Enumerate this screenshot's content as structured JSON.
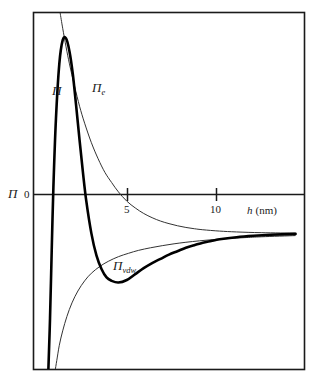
{
  "chart_data": {
    "type": "line",
    "title": "",
    "xlabel": "h (nm)",
    "ylabel": "Π",
    "xlabel_var": "h",
    "xlabel_unit": "(nm)",
    "xlim": [
      0,
      16
    ],
    "ylim": [
      -1.6,
      2.6
    ],
    "grid": false,
    "legend": "inline-annotations",
    "zero_label": "0",
    "xticks": [
      5,
      10
    ],
    "xtick_labels": [
      "5",
      "10"
    ],
    "yticks": [
      0
    ],
    "ytick_labels": [
      "0"
    ],
    "annotations": [
      {
        "name": "total-pressure-label",
        "text": "Π",
        "sub": "",
        "x": 52,
        "y": 95
      },
      {
        "name": "electrostatic-label",
        "text": "Π",
        "sub": "e",
        "x": 92,
        "y": 92
      },
      {
        "name": "vanderwaals-label",
        "text": "Π",
        "sub": "vdw",
        "x": 113,
        "y": 270
      }
    ],
    "series": [
      {
        "name": "Π",
        "label": "Π",
        "description": "Total DLVO disjoining pressure (sum of electrostatic and van der Waals); thick black curve with primary maximum, secondary minimum.",
        "style": "thick",
        "color": "#000000",
        "width": 2.6,
        "x": [
          0.85,
          0.95,
          1.05,
          1.15,
          1.3,
          1.5,
          1.7,
          1.9,
          2.1,
          2.3,
          2.5,
          2.7,
          2.9,
          3.1,
          3.4,
          3.7,
          4.0,
          4.3,
          4.6,
          5.0,
          5.5,
          6.0,
          6.5,
          7.0,
          7.5,
          8.0,
          8.5,
          9.0,
          9.5,
          10.0,
          10.5,
          11.0,
          12.0,
          13.0,
          14.0,
          15.5
        ],
        "y": [
          -1.62,
          -1.0,
          -0.2,
          0.55,
          1.35,
          2.0,
          2.28,
          2.3,
          2.15,
          1.88,
          1.5,
          1.1,
          0.72,
          0.38,
          0.0,
          -0.26,
          -0.42,
          -0.52,
          -0.56,
          -0.58,
          -0.55,
          -0.48,
          -0.41,
          -0.35,
          -0.3,
          -0.25,
          -0.21,
          -0.17,
          -0.14,
          -0.11,
          -0.09,
          -0.07,
          -0.045,
          -0.028,
          -0.016,
          -0.006
        ]
      },
      {
        "name": "Πe",
        "label": "Πe",
        "description": "Electrostatic double-layer repulsion; thin curve decaying monotonically from large positive values toward zero.",
        "style": "thin",
        "color": "#333333",
        "width": 1.0,
        "x": [
          1.55,
          1.7,
          1.9,
          2.1,
          2.4,
          2.7,
          3.0,
          3.4,
          3.8,
          4.2,
          4.6,
          5.0,
          5.5,
          6.0,
          6.5,
          7.0,
          7.5,
          8.0,
          8.5,
          9.0,
          9.5,
          10.0,
          11.0,
          12.0,
          13.5,
          15.5
        ],
        "y": [
          2.6,
          2.42,
          2.2,
          2.0,
          1.74,
          1.5,
          1.3,
          1.07,
          0.88,
          0.72,
          0.6,
          0.49,
          0.38,
          0.3,
          0.235,
          0.185,
          0.145,
          0.115,
          0.09,
          0.07,
          0.055,
          0.043,
          0.027,
          0.017,
          0.008,
          0.003
        ]
      },
      {
        "name": "Πvdw",
        "label": "Πvdw",
        "description": "van der Waals attraction; thin curve rising from large negative values asymptotically toward zero.",
        "style": "thin",
        "color": "#333333",
        "width": 1.0,
        "x": [
          1.25,
          1.35,
          1.5,
          1.7,
          1.95,
          2.25,
          2.6,
          3.0,
          3.4,
          3.9,
          4.4,
          5.0,
          5.6,
          6.2,
          6.9,
          7.6,
          8.3,
          9.0,
          9.8,
          10.6,
          11.5,
          12.5,
          13.5,
          15.5
        ],
        "y": [
          -1.62,
          -1.5,
          -1.32,
          -1.15,
          -0.98,
          -0.82,
          -0.68,
          -0.56,
          -0.47,
          -0.39,
          -0.33,
          -0.275,
          -0.235,
          -0.2,
          -0.17,
          -0.145,
          -0.123,
          -0.105,
          -0.088,
          -0.074,
          -0.061,
          -0.05,
          -0.04,
          -0.026
        ]
      }
    ]
  },
  "figure": {
    "frame": {
      "name": "plot-frame",
      "color": "#1a1a1a"
    },
    "axis_line": {
      "name": "zero-axis-line",
      "color": "#1a1a1a"
    }
  }
}
